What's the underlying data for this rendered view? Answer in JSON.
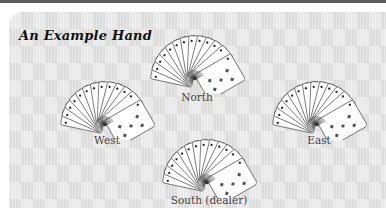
{
  "title": "An Example Hand",
  "hands": [
    {
      "id": "north",
      "label": "North"
    },
    {
      "id": "west",
      "label": "West"
    },
    {
      "id": "east",
      "label": "East"
    },
    {
      "id": "south",
      "label": "South (dealer)"
    }
  ],
  "colors": {
    "top_bar": "#5a5a5a",
    "panel_bg": "#e9e9e9",
    "diamond_pattern": "#dcdcdc",
    "card_face": "#ffffff",
    "card_outline": "#333333",
    "title_text": "#111111",
    "label_text": "#444444"
  },
  "icons": {
    "card_fan": "fan-of-13-playing-cards",
    "diamond_pip": "diamond-suit"
  }
}
